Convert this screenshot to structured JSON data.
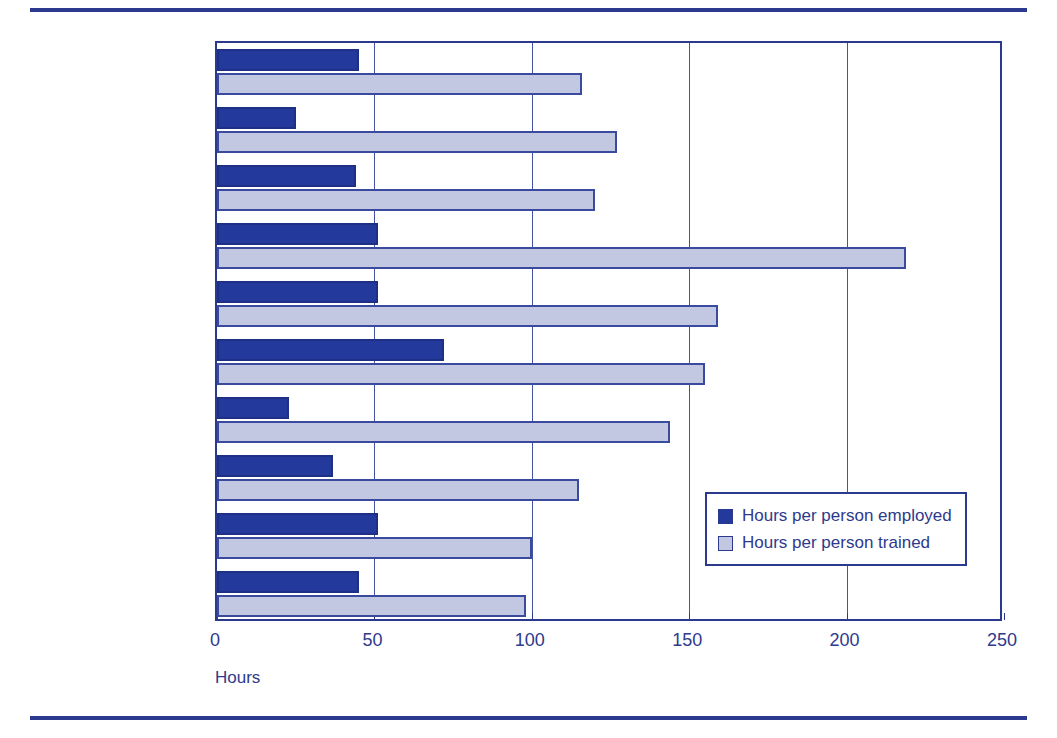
{
  "chart_data": {
    "type": "bar",
    "orientation": "horizontal",
    "title": "",
    "xlabel": "Hours",
    "ylabel": "",
    "xlim": [
      0,
      250
    ],
    "xticks": [
      0,
      50,
      100,
      150,
      200,
      250
    ],
    "xtick_labels": [
      "0",
      "50",
      "100",
      "150",
      "200",
      "250"
    ],
    "grid": true,
    "grid_axis": "x",
    "legend_position": "lower right (inside axes)",
    "categories": [
      "Australia",
      "Belgium (Flanders)",
      "Canada",
      "Ireland",
      "Netherlands",
      "New Zealand",
      "Poland",
      "Switzerland",
      "United Kingdom",
      "United States"
    ],
    "series": [
      {
        "name": "Hours per person employed",
        "color": "#233a9c",
        "values": [
          45,
          25,
          44,
          51,
          51,
          72,
          23,
          37,
          51,
          45
        ]
      },
      {
        "name": "Hours per person trained",
        "color": "#c2c8e2",
        "values": [
          116,
          127,
          120,
          219,
          159,
          155,
          144,
          115,
          100,
          98
        ]
      }
    ]
  },
  "colors": {
    "accent": "#2b3a8f",
    "series_employed": "#233a9c",
    "series_trained": "#c2c8e2",
    "text": "#2e3a8c",
    "background": "#ffffff"
  }
}
